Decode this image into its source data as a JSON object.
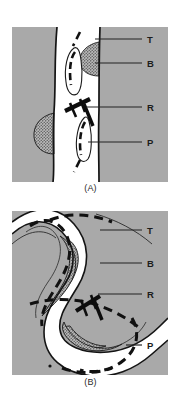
{
  "figure": {
    "type": "geological-cross-section-diagram",
    "background_color": "#ffffff",
    "ink_color": "#1a1a1a",
    "country_rock_color": "#a9a9a9",
    "vein_fill_color": "#ffffff",
    "stipple_body_color": "#9a9a9a",
    "panels": [
      {
        "id": "A",
        "caption": "(A)",
        "description": "Steeply dipping planar tabular body offset by a reverse fault",
        "labels": [
          {
            "key": "T",
            "text": "T",
            "meaning": "tabular-body-trace",
            "leader_y": 39
          },
          {
            "key": "B",
            "text": "B",
            "meaning": "stippled-ore-body",
            "leader_y": 63
          },
          {
            "key": "R",
            "text": "R",
            "meaning": "fault-or-rake-marker",
            "leader_y": 107
          },
          {
            "key": "P",
            "text": "P",
            "meaning": "pod-or-lens",
            "leader_y": 142
          }
        ]
      },
      {
        "id": "B",
        "caption": "(B)",
        "description": "Folded sinuous tabular body with the same features",
        "labels": [
          {
            "key": "T",
            "text": "T",
            "meaning": "tabular-body-trace",
            "leader_y": 230
          },
          {
            "key": "B",
            "text": "B",
            "meaning": "stippled-ore-body",
            "leader_y": 263
          },
          {
            "key": "R",
            "text": "R",
            "meaning": "fault-or-rake-marker",
            "leader_y": 294
          },
          {
            "key": "P",
            "text": "P",
            "meaning": "pod-or-lens",
            "leader_y": 345
          }
        ]
      }
    ],
    "label_column_x": 148
  }
}
